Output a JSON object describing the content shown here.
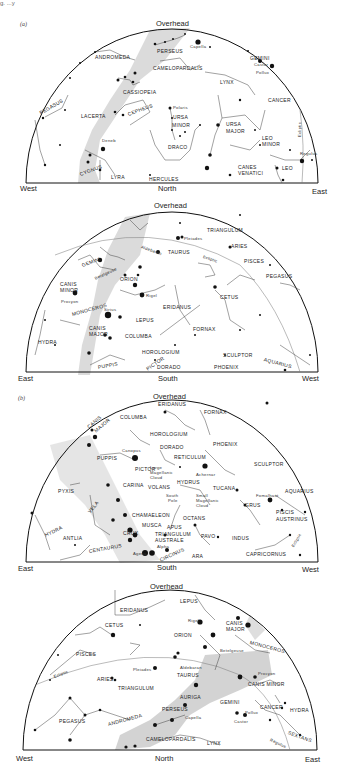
{
  "figure": {
    "header_fragment": "g. ...y",
    "parts": [
      {
        "label": "(a)"
      },
      {
        "label": "(b)"
      }
    ]
  },
  "charts": [
    {
      "id": "a-north",
      "part": "(a)",
      "overhead": "Overhead",
      "left_dir": "West",
      "center_dir": "North",
      "right_dir": "East",
      "constellations": [
        "PERSEUS",
        "ANDROMEDA",
        "CAMELOPARDALIS",
        "GEMINI",
        "LYNX",
        "CANCER",
        "PEGASUS",
        "CASSIOPEIA",
        "LACERTA",
        "CEPHEUS",
        "URSA",
        "MINOR",
        "URSA",
        "MAJOR",
        "LEO",
        "MINOR",
        "DRACO",
        "CYGNUS",
        "LYRA",
        "HERCULES",
        "CANES",
        "VENATICI",
        "LEO",
        "Ecliptic"
      ],
      "stars": [
        "Capella",
        "Castor",
        "Pollux",
        "Polaris",
        "Deneb",
        "Regulus"
      ]
    },
    {
      "id": "a-south",
      "overhead": "Overhead",
      "left_dir": "East",
      "center_dir": "South",
      "right_dir": "West",
      "constellations": [
        "TRIANGULUM",
        "ARIES",
        "TAURUS",
        "PISCES",
        "PEGASUS",
        "Ecliptic",
        "GEMINI",
        "ORION",
        "CANIS",
        "MINOR",
        "MONOCEROS",
        "CETUS",
        "ERIDANUS",
        "CANIS",
        "MAJOR",
        "LEPUS",
        "COLUMBA",
        "FORNAX",
        "HYDRA",
        "HOROLOGIUM",
        "SCULPTOR",
        "PUPPIS",
        "PICTOR",
        "DORADO",
        "PHOENIX",
        "AQUARIUS"
      ],
      "stars": [
        "Pleiades",
        "Aldebaran",
        "Betelgeuse",
        "Rigel",
        "Procyon",
        "Sirius"
      ]
    },
    {
      "id": "b-south",
      "part": "(b)",
      "overhead": "Overhead",
      "left_dir": "East",
      "center_dir": "South",
      "right_dir": "West",
      "constellations": [
        "ERIDANUS",
        "FORNAX",
        "COLUMBA",
        "CANIS",
        "MAJOR",
        "HOROLOGIUM",
        "DORADO",
        "PHOENIX",
        "PUPPIS",
        "RETICULUM",
        "SCULPTOR",
        "PICTOR",
        "PYXIS",
        "CARINA",
        "VOLANS",
        "HYDRUS",
        "TUCANA",
        "AQUARIUS",
        "VELA",
        "GRUS",
        "PISCIS",
        "AUSTRINUS",
        "CHAMAELEON",
        "OCTANS",
        "MUSCA",
        "APUS",
        "HYDRA",
        "ANTLIA",
        "CRUX",
        "TRIANGULUM",
        "AUSTRALE",
        "PAVO",
        "INDUS",
        "CENTAURUS",
        "CIRCINUS",
        "ARA",
        "CAPRICORNUS",
        "Ecliptic"
      ],
      "stars": [
        "Canopus",
        "Achernar",
        "Fomalhaut",
        "Agena",
        "Alpha"
      ],
      "objects": [
        "Large",
        "Magellanic",
        "Cloud",
        "South",
        "Pole",
        "Small",
        "Magellanic",
        "Cloud"
      ]
    },
    {
      "id": "b-north",
      "overhead": "Overhead",
      "left_dir": "West",
      "center_dir": "North",
      "right_dir": "East",
      "constellations": [
        "LEPUS",
        "ERIDANUS",
        "CETUS",
        "CANIS",
        "MAJOR",
        "ORION",
        "MONOCEROS",
        "PISCES",
        "Ecliptic",
        "TAURUS",
        "ARIES",
        "CANIS MINOR",
        "TRIANGULUM",
        "AURIGA",
        "GEMINI",
        "CANCER",
        "HYDRA",
        "PERSEUS",
        "PEGASUS",
        "ANDROMEDA",
        "SEXTANS",
        "CAMELOPARDALIS",
        "LYNX"
      ],
      "stars": [
        "Rigel",
        "Betelgeuse",
        "Aldebaran",
        "Pleiades",
        "Procyon",
        "Capella",
        "Pollux",
        "Castor",
        "Regulus"
      ]
    }
  ],
  "colors": {
    "ink": "#1a1a1a",
    "line": "#555555",
    "milky_way": "#c8c8c8",
    "background": "#ffffff"
  }
}
